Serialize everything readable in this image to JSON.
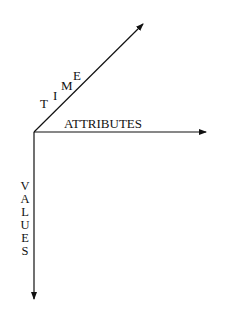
{
  "diagram": {
    "type": "three-axis data cube diagram",
    "origin": [
      34,
      132
    ],
    "axes": [
      {
        "id": "time",
        "label": "TIME",
        "letters": [
          "T",
          "I",
          "M",
          "E"
        ],
        "direction": "diagonal up-right",
        "tip": [
          144,
          23
        ]
      },
      {
        "id": "attributes",
        "label": "ATTRIBUTES",
        "direction": "right",
        "tip": [
          207,
          132
        ]
      },
      {
        "id": "values",
        "label": "VALUES",
        "letters": [
          "V",
          "A",
          "L",
          "U",
          "E",
          "S"
        ],
        "direction": "down",
        "tip": [
          34,
          300
        ]
      }
    ],
    "colors": {
      "line": "#111111",
      "background": "#ffffff"
    }
  }
}
